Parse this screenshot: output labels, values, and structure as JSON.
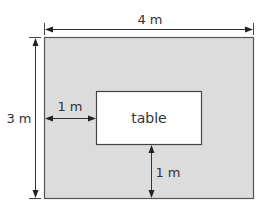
{
  "diagram": {
    "room": {
      "fill": "#dcdcdc",
      "stroke": "#555555"
    },
    "table": {
      "label": "table",
      "fill": "#ffffff",
      "stroke": "#444444"
    },
    "dimensions": {
      "width_label": "4 m",
      "height_label": "3 m",
      "left_gap_label": "1 m",
      "bottom_gap_label": "1 m"
    }
  }
}
